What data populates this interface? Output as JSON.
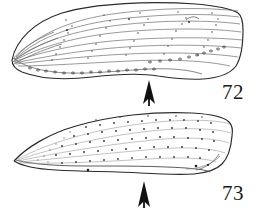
{
  "plate": {
    "kind": "scientific-illustration-plate",
    "background_color": "#ffffff",
    "ink_color": "#1a1a1a",
    "line_color": "#555555",
    "width": 264,
    "height": 208
  },
  "figures": [
    {
      "id": "figure-72",
      "number": "72",
      "subject": "beetle elytron, lateral view",
      "outline": "elongate, pointed at left apex, broadly rounded and truncate at right base",
      "surface": "longitudinal striae bearing fine punctures",
      "stria_count": 8,
      "marginal_row": "row of coarse punctures along ventral margin",
      "arrow": {
        "name": "pointer-arrow-72",
        "direction": "up",
        "tip_x": 149,
        "tip_y": 80,
        "tail_y": 106,
        "color": "#111111"
      },
      "label_position": {
        "x": 222,
        "y": 82
      }
    },
    {
      "id": "figure-73",
      "number": "73",
      "subject": "beetle elytron, lateral view",
      "outline": "elongate, sharply pointed at left apex, rounded at right base",
      "surface": "scattered rows of punctures (punctate)",
      "stria_count": 5,
      "marginal_row": "fine ventral margin line with few punctures",
      "arrow": {
        "name": "pointer-arrow-73",
        "direction": "up",
        "tip_x": 144,
        "tip_y": 181,
        "tail_y": 208,
        "color": "#111111"
      },
      "label_position": {
        "x": 222,
        "y": 183
      }
    }
  ]
}
